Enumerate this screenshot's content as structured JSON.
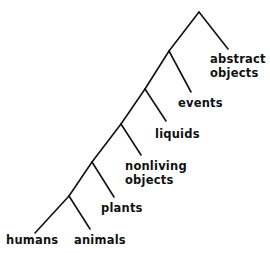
{
  "diagram": {
    "type": "taxonomy-tree",
    "line_color": "#111111",
    "edges": [
      {
        "from": "root",
        "x1": 199,
        "y1": 12,
        "x2": 228,
        "y2": 49
      },
      {
        "from": "root",
        "x1": 199,
        "y1": 12,
        "x2": 169,
        "y2": 51
      },
      {
        "from": "n2",
        "x1": 169,
        "y1": 51,
        "x2": 191,
        "y2": 92
      },
      {
        "from": "n2",
        "x1": 169,
        "y1": 51,
        "x2": 145,
        "y2": 89
      },
      {
        "from": "n3",
        "x1": 145,
        "y1": 89,
        "x2": 166,
        "y2": 121
      },
      {
        "from": "n3",
        "x1": 145,
        "y1": 89,
        "x2": 121,
        "y2": 124
      },
      {
        "from": "n4",
        "x1": 121,
        "y1": 124,
        "x2": 141,
        "y2": 155
      },
      {
        "from": "n4",
        "x1": 121,
        "y1": 124,
        "x2": 92,
        "y2": 162
      },
      {
        "from": "n5",
        "x1": 92,
        "y1": 162,
        "x2": 114,
        "y2": 197
      },
      {
        "from": "n5",
        "x1": 92,
        "y1": 162,
        "x2": 69,
        "y2": 196
      },
      {
        "from": "n6",
        "x1": 69,
        "y1": 196,
        "x2": 35,
        "y2": 233
      },
      {
        "from": "n6",
        "x1": 69,
        "y1": 196,
        "x2": 90,
        "y2": 229
      }
    ],
    "labels": [
      {
        "id": "abstract-objects",
        "lines": [
          "abstract",
          "objects"
        ],
        "x": 210,
        "y": 52
      },
      {
        "id": "events",
        "lines": [
          "events"
        ],
        "x": 178,
        "y": 96
      },
      {
        "id": "liquids",
        "lines": [
          "liquids"
        ],
        "x": 155,
        "y": 127
      },
      {
        "id": "nonliving-objects",
        "lines": [
          "nonliving",
          "objects"
        ],
        "x": 125,
        "y": 159
      },
      {
        "id": "plants",
        "lines": [
          "plants"
        ],
        "x": 101,
        "y": 201
      },
      {
        "id": "humans",
        "lines": [
          "humans"
        ],
        "x": 6,
        "y": 233
      },
      {
        "id": "animals",
        "lines": [
          "animals"
        ],
        "x": 74,
        "y": 233
      }
    ]
  }
}
